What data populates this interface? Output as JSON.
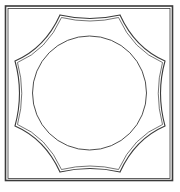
{
  "figure": {
    "stroke_color": "#3a3a3a",
    "background": "#ffffff",
    "frame": {
      "x": 6,
      "y": 6,
      "width": 166,
      "height": 174
    },
    "star_points": [
      [
        60,
        15
      ],
      [
        120,
        15
      ],
      [
        165,
        61
      ],
      [
        165,
        126
      ],
      [
        120,
        172
      ],
      [
        60,
        172
      ],
      [
        15,
        126
      ],
      [
        15,
        61
      ]
    ],
    "circle": {
      "cx": 90,
      "cy": 93,
      "r": 57
    }
  },
  "caption": {
    "text": ""
  }
}
